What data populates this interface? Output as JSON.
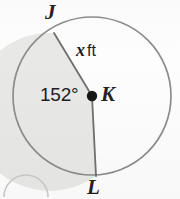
{
  "figure": {
    "kind": "circle-sector-diagram",
    "shape": "circle",
    "background_color": "#fdfdfd",
    "outline_color": "#8a8a8a",
    "shaded_fill_color": "#e8e8e6",
    "label_color": "#1e1e1e",
    "center_dot_color": "#161616",
    "circle": {
      "center_x": 92,
      "center_y": 96,
      "radius_px": 79
    },
    "points": [
      {
        "id": "J",
        "label": "J",
        "x": 54,
        "y": 33,
        "label_x": 45,
        "label_y": 2
      },
      {
        "id": "K",
        "label": "K",
        "x": 92,
        "y": 96,
        "label_x": 101,
        "label_y": 84,
        "is_center": true
      },
      {
        "id": "L",
        "label": "L",
        "x": 96,
        "y": 176,
        "label_x": 87,
        "label_y": 177
      }
    ],
    "radii": [
      {
        "from": "K",
        "to": "J"
      },
      {
        "from": "K",
        "to": "L"
      }
    ],
    "angle": {
      "vertex": "K",
      "value": 152,
      "unit": "degrees",
      "text": "152°",
      "shaded": true,
      "shaded_side": "left"
    },
    "radius_measure": {
      "text": "x ft",
      "variable": "x",
      "unit": "ft",
      "applies_to": "KJ"
    },
    "partial_marker": {
      "description": "faint arc fragment of an adjacent problem-number circle",
      "location": "bottom-left"
    }
  }
}
